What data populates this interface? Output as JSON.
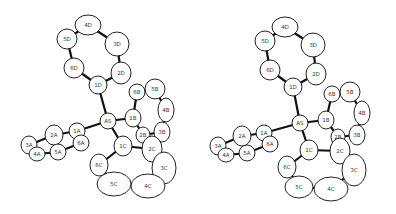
{
  "figure": {
    "type": "ORTEP stereo pair",
    "views": [
      {
        "name": "left-view",
        "dx": 0,
        "atoms": [
          {
            "id": "4D",
            "x": 88,
            "y": 25,
            "rx": 13,
            "ry": 10
          },
          {
            "id": "5D",
            "x": 67,
            "y": 39,
            "rx": 10,
            "ry": 10
          },
          {
            "id": "3D",
            "x": 117,
            "y": 44,
            "rx": 12,
            "ry": 12
          },
          {
            "id": "6D",
            "x": 74,
            "y": 68,
            "rx": 10,
            "ry": 10
          },
          {
            "id": "2D",
            "x": 121,
            "y": 73,
            "rx": 10,
            "ry": 11
          },
          {
            "id": "1D",
            "x": 98,
            "y": 85,
            "rx": 9,
            "ry": 9
          },
          {
            "id": "AS",
            "x": 108,
            "y": 121,
            "rx": 8,
            "ry": 8
          },
          {
            "id": "1B",
            "x": 133,
            "y": 118,
            "rx": 8,
            "ry": 9
          },
          {
            "id": "6B",
            "x": 137,
            "y": 92,
            "rx": 8,
            "ry": 8
          },
          {
            "id": "5B",
            "x": 155,
            "y": 89,
            "rx": 10,
            "ry": 10
          },
          {
            "id": "4B",
            "x": 166,
            "y": 110,
            "rx": 8,
            "ry": 12
          },
          {
            "id": "3B",
            "x": 162,
            "y": 132,
            "rx": 8,
            "ry": 10
          },
          {
            "id": "2B",
            "x": 143,
            "y": 135,
            "rx": 7,
            "ry": 8
          },
          {
            "id": "1C",
            "x": 123,
            "y": 146,
            "rx": 9,
            "ry": 10
          },
          {
            "id": "2C",
            "x": 152,
            "y": 149,
            "rx": 10,
            "ry": 13
          },
          {
            "id": "3C",
            "x": 164,
            "y": 168,
            "rx": 12,
            "ry": 16
          },
          {
            "id": "4C",
            "x": 148,
            "y": 186,
            "rx": 17,
            "ry": 12
          },
          {
            "id": "5C",
            "x": 114,
            "y": 184,
            "rx": 17,
            "ry": 12
          },
          {
            "id": "6C",
            "x": 99,
            "y": 165,
            "rx": 9,
            "ry": 11
          },
          {
            "id": "1A",
            "x": 77,
            "y": 131,
            "rx": 8,
            "ry": 8
          },
          {
            "id": "2A",
            "x": 54,
            "y": 135,
            "rx": 9,
            "ry": 10
          },
          {
            "id": "3A",
            "x": 29,
            "y": 145,
            "rx": 8,
            "ry": 9
          },
          {
            "id": "4A",
            "x": 37,
            "y": 154,
            "rx": 8,
            "ry": 7
          },
          {
            "id": "5A",
            "x": 58,
            "y": 152,
            "rx": 8,
            "ry": 8
          },
          {
            "id": "6A",
            "x": 81,
            "y": 143,
            "rx": 8,
            "ry": 8
          }
        ]
      },
      {
        "name": "right-view",
        "dx": 190,
        "atoms": [
          {
            "id": "4D",
            "x": 95,
            "y": 27,
            "rx": 13,
            "ry": 10
          },
          {
            "id": "5D",
            "x": 75,
            "y": 41,
            "rx": 10,
            "ry": 10
          },
          {
            "id": "3D",
            "x": 123,
            "y": 45,
            "rx": 12,
            "ry": 12
          },
          {
            "id": "6D",
            "x": 80,
            "y": 70,
            "rx": 10,
            "ry": 10
          },
          {
            "id": "2D",
            "x": 126,
            "y": 74,
            "rx": 10,
            "ry": 11
          },
          {
            "id": "1D",
            "x": 103,
            "y": 87,
            "rx": 9,
            "ry": 9
          },
          {
            "id": "AS",
            "x": 110,
            "y": 123,
            "rx": 8,
            "ry": 8
          },
          {
            "id": "1B",
            "x": 136,
            "y": 120,
            "rx": 8,
            "ry": 9
          },
          {
            "id": "6B",
            "x": 142,
            "y": 94,
            "rx": 8,
            "ry": 8
          },
          {
            "id": "5B",
            "x": 160,
            "y": 92,
            "rx": 10,
            "ry": 10
          },
          {
            "id": "4B",
            "x": 172,
            "y": 113,
            "rx": 8,
            "ry": 12
          },
          {
            "id": "3B",
            "x": 167,
            "y": 135,
            "rx": 8,
            "ry": 10
          },
          {
            "id": "2B",
            "x": 148,
            "y": 137,
            "rx": 7,
            "ry": 8
          },
          {
            "id": "1C",
            "x": 119,
            "y": 150,
            "rx": 9,
            "ry": 10
          },
          {
            "id": "2C",
            "x": 150,
            "y": 151,
            "rx": 10,
            "ry": 13
          },
          {
            "id": "3C",
            "x": 164,
            "y": 170,
            "rx": 12,
            "ry": 16
          },
          {
            "id": "4C",
            "x": 141,
            "y": 189,
            "rx": 17,
            "ry": 12
          },
          {
            "id": "5C",
            "x": 109,
            "y": 187,
            "rx": 14,
            "ry": 11
          },
          {
            "id": "6C",
            "x": 97,
            "y": 167,
            "rx": 9,
            "ry": 11
          },
          {
            "id": "1A",
            "x": 74,
            "y": 133,
            "rx": 8,
            "ry": 8
          },
          {
            "id": "2A",
            "x": 52,
            "y": 136,
            "rx": 9,
            "ry": 10
          },
          {
            "id": "3A",
            "x": 28,
            "y": 146,
            "rx": 8,
            "ry": 9
          },
          {
            "id": "4A",
            "x": 36,
            "y": 155,
            "rx": 8,
            "ry": 7
          },
          {
            "id": "5A",
            "x": 57,
            "y": 153,
            "rx": 8,
            "ry": 8
          },
          {
            "id": "6A",
            "x": 80,
            "y": 144,
            "rx": 8,
            "ry": 8
          }
        ]
      }
    ],
    "bonds": [
      [
        "4D",
        "5D"
      ],
      [
        "4D",
        "3D"
      ],
      [
        "5D",
        "6D"
      ],
      [
        "3D",
        "2D"
      ],
      [
        "6D",
        "1D"
      ],
      [
        "2D",
        "1D"
      ],
      [
        "1D",
        "AS"
      ],
      [
        "AS",
        "1B"
      ],
      [
        "AS",
        "1C"
      ],
      [
        "AS",
        "1A"
      ],
      [
        "1B",
        "6B"
      ],
      [
        "6B",
        "5B"
      ],
      [
        "5B",
        "4B"
      ],
      [
        "4B",
        "3B"
      ],
      [
        "3B",
        "2B"
      ],
      [
        "2B",
        "1B"
      ],
      [
        "1C",
        "2C"
      ],
      [
        "2C",
        "3C"
      ],
      [
        "3C",
        "4C"
      ],
      [
        "4C",
        "5C"
      ],
      [
        "5C",
        "6C"
      ],
      [
        "6C",
        "1C"
      ],
      [
        "1A",
        "2A"
      ],
      [
        "2A",
        "3A"
      ],
      [
        "3A",
        "4A"
      ],
      [
        "4A",
        "5A"
      ],
      [
        "5A",
        "6A"
      ],
      [
        "6A",
        "1A"
      ]
    ]
  }
}
